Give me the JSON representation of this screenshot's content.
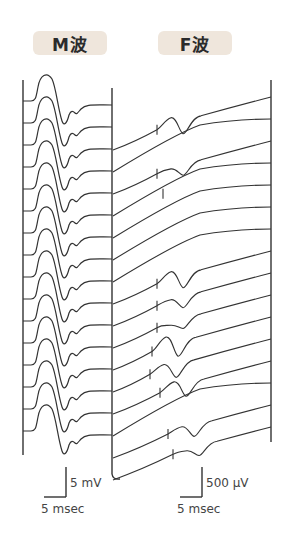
{
  "panels": {
    "m_wave": {
      "title": "M波",
      "trace_count": 16
    },
    "f_wave": {
      "title": "F波",
      "trace_count": 16
    }
  },
  "scale_bars": {
    "m_wave": {
      "amplitude": "5 mV",
      "time": "5 msec"
    },
    "f_wave": {
      "amplitude": "500 μV",
      "time": "5 msec"
    }
  },
  "colors": {
    "trace": "#333333",
    "badge_bg": "#efe6dc",
    "badge_text": "#2b2b2b"
  }
}
